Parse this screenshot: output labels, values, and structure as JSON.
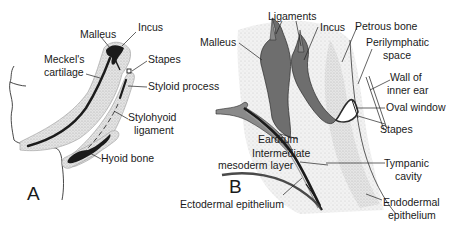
{
  "figure": {
    "panels": [
      {
        "id": "A",
        "letter": "A",
        "labels": {
          "malleus": "Malleus",
          "incus": "Incus",
          "meckels_cartilage_1": "Meckel's",
          "meckels_cartilage_2": "cartilage",
          "stapes": "Stapes",
          "styloid_process": "Styloid process",
          "stylohyoid_ligament_1": "Stylohyoid",
          "stylohyoid_ligament_2": "ligament",
          "hyoid_bone": "Hyoid bone"
        }
      },
      {
        "id": "B",
        "letter": "B",
        "labels": {
          "ligaments": "Ligaments",
          "malleus": "Malleus",
          "incus": "Incus",
          "petrous_bone": "Petrous bone",
          "perilymphatic_space_1": "Perilymphatic",
          "perilymphatic_space_2": "space",
          "wall_inner_ear_1": "Wall of",
          "wall_inner_ear_2": "inner ear",
          "oval_window": "Oval window",
          "stapes": "Stapes",
          "eardrum": "Eardrum",
          "intermediate_mesoderm_1": "Intermediate",
          "intermediate_mesoderm_2": "mesoderm layer",
          "tympanic_cavity_1": "Tympanic",
          "tympanic_cavity_2": "cavity",
          "ectodermal_epithelium": "Ectodermal epithelium",
          "endodermal_epithelium_1": "Endodermal",
          "endodermal_epithelium_2": "epithelium"
        }
      }
    ],
    "colors": {
      "stipple": "#d6d6d6",
      "stipple_edge": "#9a9a9a",
      "cartilage": "#1b1b1b",
      "ossicle_fill": "#6e6e6e",
      "line": "#222222"
    }
  }
}
